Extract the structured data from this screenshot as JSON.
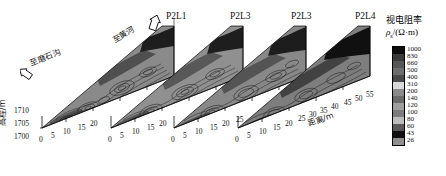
{
  "figure": {
    "type": "geoelectric-resistivity-pseudosection-3d",
    "background": "#ffffff"
  },
  "annotations": {
    "to_moshigou": "至磨石沟",
    "to_yellow_river": "至黄河"
  },
  "axes": {
    "y_axis_title": "高程/m",
    "y_ticks": [
      "1710",
      "1705",
      "1700"
    ],
    "x_axis_title": "距离/m"
  },
  "panels": [
    {
      "id": "p2l1",
      "label": "P2L1",
      "x_ticks": [
        "0",
        "5",
        "10",
        "15",
        "20"
      ]
    },
    {
      "id": "p2l3-a",
      "label": "P2L3",
      "x_ticks": [
        "0",
        "5",
        "10",
        "15",
        "20"
      ]
    },
    {
      "id": "p2l3-b",
      "label": "P2L3",
      "x_ticks": [
        "0",
        "5",
        "10",
        "15",
        "20",
        "25"
      ]
    },
    {
      "id": "p2l4",
      "label": "P2L4",
      "x_ticks": [
        "0",
        "5",
        "10",
        "15",
        "20",
        "25",
        "30",
        "35",
        "40",
        "45",
        "50",
        "55"
      ]
    }
  ],
  "legend": {
    "title": "视电阻率",
    "symbol": "ρ",
    "symbol_sub": "s",
    "unit": "/(Ω·m)",
    "levels": [
      {
        "value": "1000",
        "color": "#0d0d0d"
      },
      {
        "value": "830",
        "color": "#3a3a3a"
      },
      {
        "value": "660",
        "color": "#565656"
      },
      {
        "value": "500",
        "color": "#6e6e6e"
      },
      {
        "value": "400",
        "color": "#4a4a4a"
      },
      {
        "value": "310",
        "color": "#d9d9d9"
      },
      {
        "value": "200",
        "color": "#8a8a8a"
      },
      {
        "value": "140",
        "color": "#6a6a6a"
      },
      {
        "value": "120",
        "color": "#9e9e9e"
      },
      {
        "value": "100",
        "color": "#7c7c7c"
      },
      {
        "value": "80",
        "color": "#bdbdbd"
      },
      {
        "value": "60",
        "color": "#5a5a5a"
      },
      {
        "value": "43",
        "color": "#111111"
      },
      {
        "value": "26",
        "color": "#8f8f8f"
      }
    ]
  },
  "chart_data": {
    "type": "heatmap",
    "title": "",
    "xlabel": "距离/m",
    "ylabel": "高程/m",
    "colorbar_label": "视电阻率 ρs/(Ω·m)",
    "colorbar_levels": [
      26,
      43,
      60,
      80,
      100,
      120,
      140,
      200,
      310,
      400,
      500,
      660,
      830,
      1000
    ],
    "ylim": [
      1700,
      1712
    ],
    "y_ticks": [
      1700,
      1705,
      1710
    ],
    "panels": [
      {
        "name": "P2L1",
        "xlim": [
          0,
          22
        ],
        "x_ticks": [
          0,
          5,
          10,
          15,
          20
        ]
      },
      {
        "name": "P2L3",
        "xlim": [
          0,
          22
        ],
        "x_ticks": [
          0,
          5,
          10,
          15,
          20
        ]
      },
      {
        "name": "P2L3",
        "xlim": [
          0,
          27
        ],
        "x_ticks": [
          0,
          5,
          10,
          15,
          20,
          25
        ]
      },
      {
        "name": "P2L4",
        "xlim": [
          0,
          57
        ],
        "x_ticks": [
          0,
          5,
          10,
          15,
          20,
          25,
          30,
          35,
          40,
          45,
          50,
          55
        ]
      }
    ],
    "annotations": [
      "至磨石沟",
      "至黄河"
    ],
    "grid": false,
    "legend_position": "right"
  }
}
